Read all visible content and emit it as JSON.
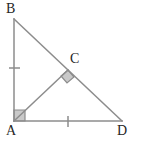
{
  "figure": {
    "background_color": "#ffffff",
    "stroke_color": "#8c8c8c",
    "stroke_width": 1.5,
    "marker_fill_color": "#c9c9c9",
    "marker_stroke_color": "#8c8c8c",
    "label_color": "#262626",
    "label_font_size": 14
  },
  "points": {
    "B": {
      "label": "B",
      "x": 14,
      "y": 19
    },
    "A": {
      "label": "A",
      "x": 14,
      "y": 121
    },
    "D": {
      "label": "D",
      "x": 122,
      "y": 121
    },
    "C": {
      "label": "C",
      "x": 68,
      "y": 70
    }
  },
  "segments": [
    {
      "name": "AB",
      "from": "A",
      "to": "B",
      "path": "M 14 121 L 14 19"
    },
    {
      "name": "BD",
      "from": "B",
      "to": "D",
      "path": "M 14 19 L 122 121"
    },
    {
      "name": "AD",
      "from": "A",
      "to": "D",
      "path": "M 14 121 L 122 121"
    },
    {
      "name": "AC",
      "from": "A",
      "to": "C",
      "path": "M 14 121 L 68 70"
    }
  ],
  "right_angle_markers": [
    {
      "name": "right-angle-at-A",
      "at": "A",
      "style": "square",
      "points": "14,121 14,110 25,110 25,121"
    },
    {
      "name": "right-angle-at-C",
      "at": "C",
      "style": "rotated-square",
      "points": "68,70 61,76 67,83 74,77"
    }
  ],
  "tick_marks": [
    {
      "name": "tick-on-AB",
      "on_segment": "AB",
      "orientation": "horizontal",
      "path": "M 9 68 L 20 68"
    },
    {
      "name": "tick-on-AD",
      "on_segment": "AD",
      "orientation": "vertical",
      "path": "M 68 116 L 68 127"
    }
  ],
  "labels": {
    "B": "B",
    "C": "C",
    "A": "A",
    "D": "D"
  }
}
